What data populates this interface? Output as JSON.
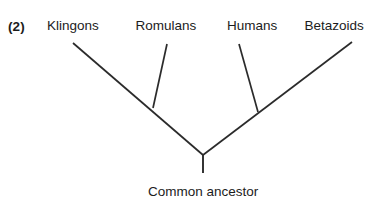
{
  "figure": {
    "number_label": "(2)",
    "background_color": "#ffffff",
    "line_color": "#2b2b2b",
    "text_color": "#1c1c1c"
  },
  "taxa": [
    {
      "label": "Klingons",
      "center_x": 73,
      "label_y": 19
    },
    {
      "label": "Romulans",
      "center_x": 166,
      "label_y": 19
    },
    {
      "label": "Humans",
      "center_x": 252,
      "label_y": 19
    },
    {
      "label": "Betazoids",
      "center_x": 334,
      "label_y": 19
    }
  ],
  "root": {
    "label": "Common ancestor",
    "center_x": 203,
    "label_y": 185
  },
  "chart_data": {
    "type": "diagram",
    "diagram_kind": "phylogenetic-tree",
    "title": "(2)",
    "leaves": [
      "Klingons",
      "Romulans",
      "Humans",
      "Betazoids"
    ],
    "root_label": "Common ancestor",
    "topology": "(((Klingons,Romulans),(Humans,Betazoids)))",
    "nodes": {
      "root": {
        "x": 203,
        "y": 155
      },
      "left_internal": {
        "x": 153,
        "y": 108
      },
      "right_internal": {
        "x": 258,
        "y": 112
      },
      "klingons_tip": {
        "x": 73,
        "y": 43
      },
      "romulans_tip": {
        "x": 167,
        "y": 44
      },
      "humans_tip": {
        "x": 239,
        "y": 44
      },
      "betazoids_tip": {
        "x": 352,
        "y": 42
      }
    },
    "edges": [
      {
        "name": "klingons-branch",
        "from": [
          73,
          43
        ],
        "to": [
          203,
          155
        ]
      },
      {
        "name": "romulans-branch",
        "from": [
          167,
          44
        ],
        "to": [
          153,
          108
        ]
      },
      {
        "name": "humans-branch",
        "from": [
          239,
          44
        ],
        "to": [
          258,
          112
        ]
      },
      {
        "name": "betazoids-branch",
        "from": [
          352,
          42
        ],
        "to": [
          203,
          155
        ]
      },
      {
        "name": "root-stem",
        "from": [
          203,
          155
        ],
        "to": [
          203,
          173
        ]
      }
    ]
  }
}
